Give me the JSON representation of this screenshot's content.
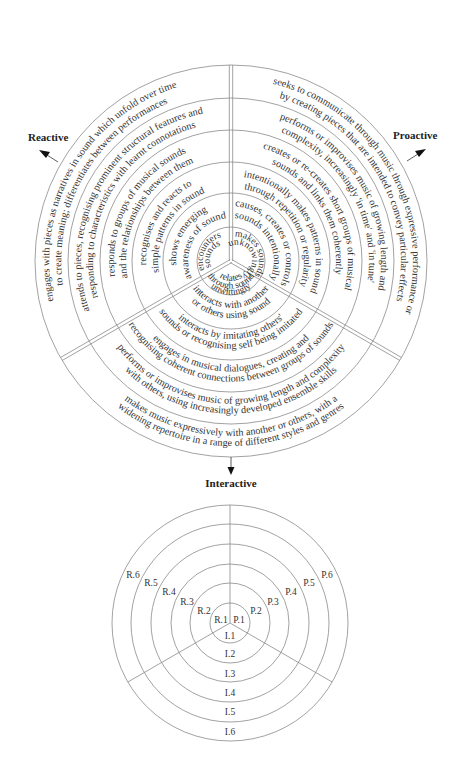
{
  "axes": {
    "reactive": "Reactive",
    "proactive": "Proactive",
    "interactive": "Interactive"
  },
  "reactive": {
    "levels": [
      {
        "level": "R.1",
        "lines": [
          "encounters",
          "sounds"
        ]
      },
      {
        "level": "R.2",
        "lines": [
          "shows emerging",
          "awareness of sound"
        ]
      },
      {
        "level": "R.3",
        "lines": [
          "recognises and reacts to",
          "simple patterns in sound"
        ]
      },
      {
        "level": "R.4",
        "lines": [
          "responds to groups of musical sounds",
          "and the relationships between them"
        ]
      },
      {
        "level": "R.5",
        "lines": [
          "attends to pieces, recognising prominent structural features and",
          "responding to characteristics with learnt connotations"
        ]
      },
      {
        "level": "R.6",
        "lines": [
          "engages with pieces as narratives in sound which unfold over time",
          "to create meaning; differentiates between performances"
        ]
      }
    ]
  },
  "proactive": {
    "levels": [
      {
        "level": "P.1",
        "lines": [
          "makes sounds",
          "unknowingly"
        ]
      },
      {
        "level": "P.2",
        "lines": [
          "causes, creates or controls",
          "sounds intentionally"
        ]
      },
      {
        "level": "P.3",
        "lines": [
          "intentionally makes patterns in sound",
          "through repetition or regularity"
        ]
      },
      {
        "level": "P.4",
        "lines": [
          "creates or re-creates short groups of musical",
          "sounds and links them coherently"
        ]
      },
      {
        "level": "P.5",
        "lines": [
          "performs or improvises music of growing length and",
          "complexity, increasingly 'in time' and 'in tune'"
        ]
      },
      {
        "level": "P.6",
        "lines": [
          "seeks to communicate through music through expressive performance or",
          "by creating pieces that are intended to convey particular effects"
        ]
      }
    ]
  },
  "interactive": {
    "levels": [
      {
        "level": "I.1",
        "lines": [
          "relates",
          "through sound",
          "unwittingly"
        ]
      },
      {
        "level": "I.2",
        "lines": [
          "interacts with another",
          "or others using sound"
        ]
      },
      {
        "level": "I.3",
        "lines": [
          "interacts by imitating others'",
          "sounds or recognising self being imitated"
        ]
      },
      {
        "level": "I.4",
        "lines": [
          "engages in musical dialogues, creating and",
          "recognising coherent connections between groups of sounds"
        ]
      },
      {
        "level": "I.5",
        "lines": [
          "performs or improvises music of growing length and complexity",
          "with others, using increasingly developed ensemble skills"
        ]
      },
      {
        "level": "I.6",
        "lines": [
          "makes music expressively with another or others, with a",
          "widening repertoire in a range of different styles and genres"
        ]
      }
    ]
  },
  "key": {
    "reactive_codes": [
      "R.1",
      "R.2",
      "R.3",
      "R.4",
      "R.5",
      "R.6"
    ],
    "proactive_codes": [
      "P.1",
      "P.2",
      "P.3",
      "P.4",
      "P.5",
      "P.6"
    ],
    "interactive_codes": [
      "I.1",
      "I.2",
      "I.3",
      "I.4",
      "I.5",
      "I.6"
    ]
  }
}
